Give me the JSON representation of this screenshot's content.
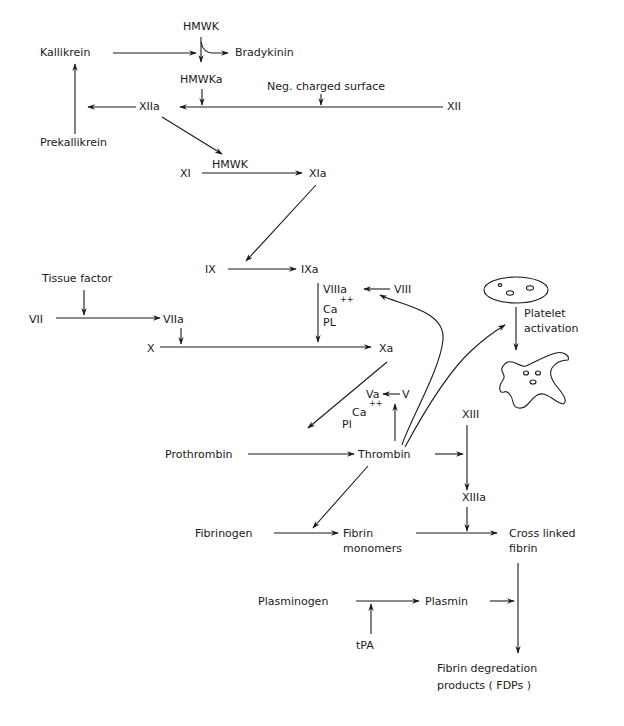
{
  "colors": {
    "ink": "#1a1a1a",
    "background": "#ffffff"
  },
  "nodes": {
    "hmwk_top": "HMWK",
    "kallikrein": "Kallikrein",
    "bradykinin": "Bradykinin",
    "hmwka": "HMWKa",
    "neg_surface": "Neg. charged surface",
    "xiia": "XIIa",
    "xii": "XII",
    "prekallikrein": "Prekallikrein",
    "xi": "XI",
    "hmwk_xi": "HMWK",
    "xia": "XIa",
    "ix": "IX",
    "ixa": "IXa",
    "tissue_factor": "Tissue factor",
    "vii": "VII",
    "viia": "VIIa",
    "viiia": "VIIIa",
    "viii": "VIII",
    "ca_1": "Ca",
    "ca_1_sup": "++",
    "pl_1": "PL",
    "x": "X",
    "xa": "Xa",
    "platelet_label_1": "Platelet",
    "platelet_label_2": "activation",
    "va": "Va",
    "v": "V",
    "ca_2": "Ca",
    "ca_2_sup": "++",
    "pl_2": "Pl",
    "xiii": "XIII",
    "prothrombin": "Prothrombin",
    "thrombin": "Thrombin",
    "xiiia": "XIIIa",
    "fibrinogen": "Fibrinogen",
    "fibrin_monomers_1": "Fibrin",
    "fibrin_monomers_2": "monomers",
    "cross_linked_1": "Cross linked",
    "cross_linked_2": "fibrin",
    "plasminogen": "Plasminogen",
    "plasmin": "Plasmin",
    "tpa": "tPA",
    "fdp_1": "Fibrin degredation",
    "fdp_2": "products ( FDPs )"
  },
  "edges": [
    {
      "from": "HMWK",
      "to": "HMWKa"
    },
    {
      "from": "HMWK",
      "to": "Bradykinin"
    },
    {
      "from": "Kallikrein",
      "to": "HMWK→HMWKa"
    },
    {
      "from": "XII",
      "to": "XIIa",
      "modifiers": [
        "HMWKa",
        "Neg. charged surface"
      ]
    },
    {
      "from": "XIIa",
      "to": "Prekallikrein→Kallikrein"
    },
    {
      "from": "Prekallikrein",
      "to": "Kallikrein"
    },
    {
      "from": "XIIa",
      "to": "XI→XIa"
    },
    {
      "from": "XI",
      "to": "XIa",
      "modifiers": [
        "HMWK"
      ]
    },
    {
      "from": "XIa",
      "to": "IX→IXa"
    },
    {
      "from": "IX",
      "to": "IXa"
    },
    {
      "from": "VII",
      "to": "VIIa",
      "modifiers": [
        "Tissue factor"
      ]
    },
    {
      "from": "VIIa",
      "to": "X→Xa"
    },
    {
      "from": "IXa",
      "to": "X→Xa",
      "modifiers": [
        "VIIIa",
        "Ca++",
        "PL"
      ]
    },
    {
      "from": "VIII",
      "to": "VIIIa"
    },
    {
      "from": "Thrombin",
      "to": "VIII→VIIIa"
    },
    {
      "from": "X",
      "to": "Xa"
    },
    {
      "from": "Xa",
      "to": "Prothrombin→Thrombin"
    },
    {
      "from": "V",
      "to": "Va"
    },
    {
      "from": "Thrombin",
      "to": "V→Va"
    },
    {
      "from": "Prothrombin",
      "to": "Thrombin",
      "modifiers": [
        "Va",
        "Ca++",
        "Pl"
      ]
    },
    {
      "from": "Thrombin",
      "to": "Platelet activation"
    },
    {
      "from": "Thrombin",
      "to": "XIII→XIIIa"
    },
    {
      "from": "XIII",
      "to": "XIIIa"
    },
    {
      "from": "Thrombin",
      "to": "Fibrinogen→Fibrin monomers"
    },
    {
      "from": "Fibrinogen",
      "to": "Fibrin monomers"
    },
    {
      "from": "Fibrin monomers",
      "to": "Cross linked fibrin",
      "modifiers": [
        "XIIIa"
      ]
    },
    {
      "from": "Plasminogen",
      "to": "Plasmin",
      "modifiers": [
        "tPA"
      ]
    },
    {
      "from": "Plasmin",
      "to": "Cross linked fibrin→FDPs"
    },
    {
      "from": "Cross linked fibrin",
      "to": "Fibrin degredation products (FDPs)"
    }
  ]
}
